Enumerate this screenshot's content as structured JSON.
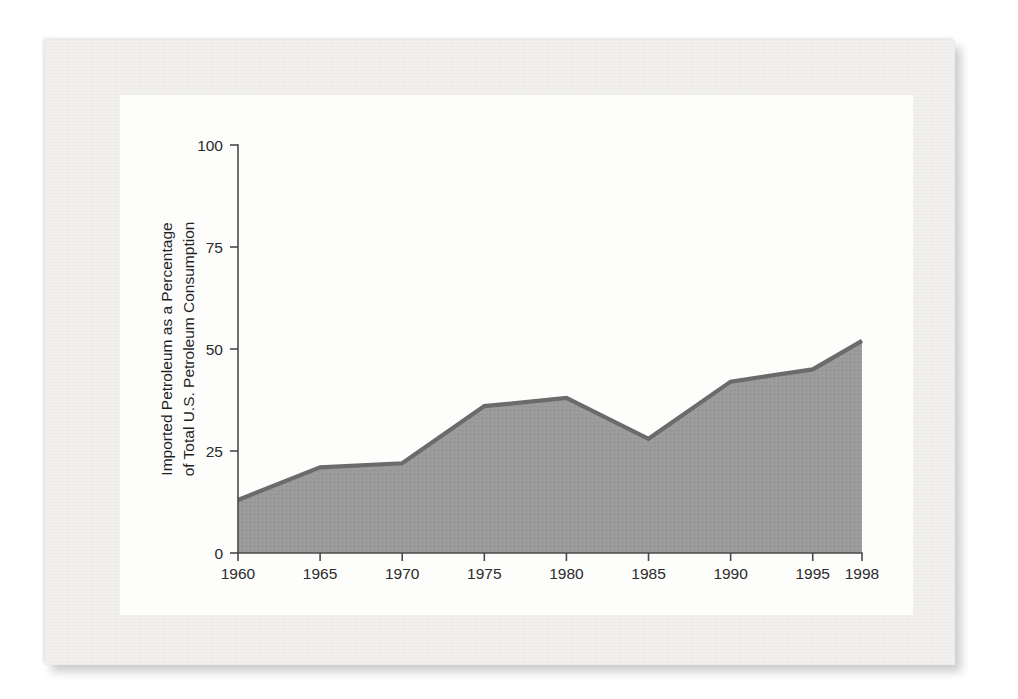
{
  "figure": {
    "card_background": "#fdfdfc",
    "panel_background": "#f2f1ef"
  },
  "chart_data": {
    "type": "area",
    "title": "",
    "subtitle": "",
    "xlabel": "",
    "ylabel": "Imported Petroleum as a Percentage of Total U.S. Petroleum Consumption",
    "ylabel_line1": "Imported Petroleum as a Percentage",
    "ylabel_line2": "of Total U.S. Petroleum Consumption",
    "x": [
      1960,
      1965,
      1970,
      1975,
      1980,
      1985,
      1990,
      1995,
      1998
    ],
    "categories": [
      "1960",
      "1965",
      "1970",
      "1975",
      "1980",
      "1985",
      "1990",
      "1995",
      "1998"
    ],
    "values": [
      13,
      21,
      22,
      36,
      38,
      28,
      42,
      45,
      52
    ],
    "series": [
      {
        "name": "Imported Petroleum Share",
        "values": [
          13,
          21,
          22,
          36,
          38,
          28,
          42,
          45,
          52
        ],
        "fill_color": "#9b9b9b",
        "line_color": "#6b6b6b"
      }
    ],
    "xlim": [
      1960,
      1998
    ],
    "ylim": [
      0,
      100
    ],
    "xticks": [
      1960,
      1965,
      1970,
      1975,
      1980,
      1985,
      1990,
      1995,
      1998
    ],
    "xtick_labels": [
      "1960",
      "1965",
      "1970",
      "1975",
      "1980",
      "1985",
      "1990",
      "1995",
      "1998"
    ],
    "yticks": [
      0,
      25,
      50,
      75,
      100
    ],
    "ytick_labels": [
      "0",
      "25",
      "50",
      "75",
      "100"
    ],
    "grid": false,
    "legend": false,
    "legend_position": "none",
    "annotations": []
  }
}
